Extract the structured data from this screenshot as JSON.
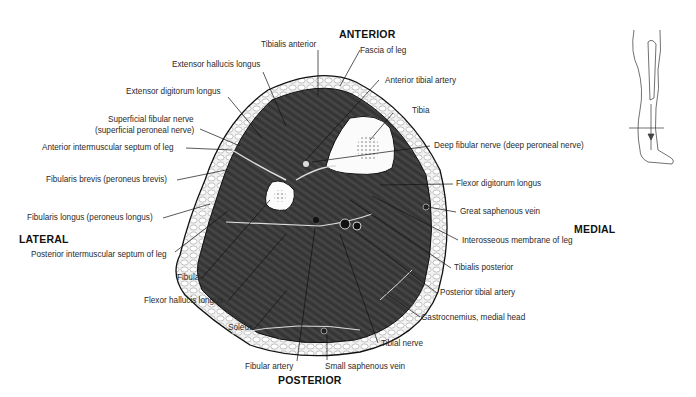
{
  "diagram": {
    "type": "anatomical cross-section",
    "orientation": {
      "anterior": "ANTERIOR",
      "posterior": "POSTERIOR",
      "lateral": "LATERAL",
      "medial": "MEDIAL"
    },
    "labels": {
      "tibialis_anterior": "Tibialis anterior",
      "fascia_of_leg": "Fascia of leg",
      "extensor_hallucis_longus": "Extensor hallucis longus",
      "anterior_tibial_artery": "Anterior tibial artery",
      "extensor_digitorum_longus": "Extensor digitorum longus",
      "tibia": "Tibia",
      "superficial_fibular_nerve_1": "Superficial fibular nerve",
      "superficial_fibular_nerve_2": "(superficial peroneal nerve)",
      "deep_fibular_nerve": "Deep fibular nerve (deep peroneal nerve)",
      "anterior_intermuscular_septum": "Anterior intermuscular septum of leg",
      "fibularis_brevis": "Fibularis brevis (peroneus brevis)",
      "flexor_digitorum_longus": "Flexor digitorum longus",
      "fibularis_longus": "Fibularis longus (peroneus longus)",
      "great_saphenous_vein": "Great saphenous vein",
      "interosseous_membrane": "Interosseous membrane of leg",
      "posterior_intermuscular_septum": "Posterior intermuscular septum of leg",
      "tibialis_posterior": "Tibialis posterior",
      "fibula": "Fibula",
      "posterior_tibial_artery": "Posterior tibial artery",
      "flexor_hallucis_longus": "Flexor hallucis longus",
      "gastrocnemius_medial_head": "Gastrocnemius, medial head",
      "soleus": "Soleus",
      "tibial_nerve": "Tibial nerve",
      "fibular_artery": "Fibular artery",
      "small_saphenous_vein": "Small saphenous vein"
    },
    "inset": {
      "description": "Leg silhouette with horizontal section line at lower leg"
    },
    "colors": {
      "muscle": "#3a3a3a",
      "fat": "#e8e8e8",
      "bone": "#f7f7f7",
      "line": "#111111"
    }
  }
}
